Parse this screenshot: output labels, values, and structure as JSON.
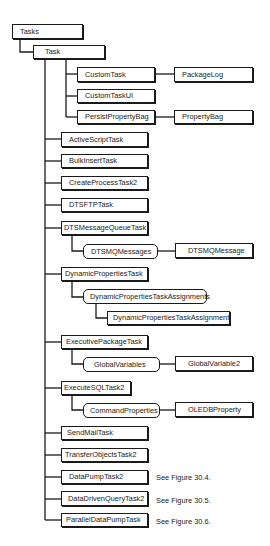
{
  "diagram": {
    "root": "Tasks",
    "task": "Task",
    "custom_task": "CustomTask",
    "package_log": "PackageLog",
    "custom_task_ui": "CustomTaskUI",
    "persist_property_bag": "PersistPropertyBag",
    "property_bag": "PropertyBag",
    "active_script_task": "ActiveScriptTask",
    "bulk_insert_task": "BulkInsertTask",
    "create_process_task2": "CreateProcessTask2",
    "dtsftp_task": "DTSFTPTask",
    "dts_message_queue_task": "DTSMessageQueueTask",
    "dtsmq_messages": "DTSMQMessages",
    "dtsmq_message": "DTSMQMessage",
    "dynamic_properties_task": "DynamicPropertiesTask",
    "dpt_assignments": "DynamicPropertiesTaskAssignments",
    "dpt_assignment": "DynamicPropertiesTaskAssignment",
    "executive_package_task": "ExecutivePackageTask",
    "global_variables": "GlobalVariables",
    "global_variable2": "GlobalVariable2",
    "execute_sql_task2": "ExecuteSQLTask2",
    "command_properties": "CommandProperties",
    "oledb_property": "OLEDBProperty",
    "send_mail_task": "SendMailTask",
    "transfer_objects_task2": "TransferObjectsTask2",
    "data_pump_task2": "DataPumpTask2",
    "data_driven_query_task2": "DataDrivenQueryTask2",
    "parallel_data_pump_task": "ParallelDataPumpTask",
    "notes": {
      "data_pump": "See Figure 30.4.",
      "data_driven_query": "See Figure 30.5.",
      "parallel_data_pump": "See Figure 30.6."
    }
  },
  "colors": {
    "line": "#1a1a1a",
    "text": "#222222",
    "background": "#ffffff"
  }
}
